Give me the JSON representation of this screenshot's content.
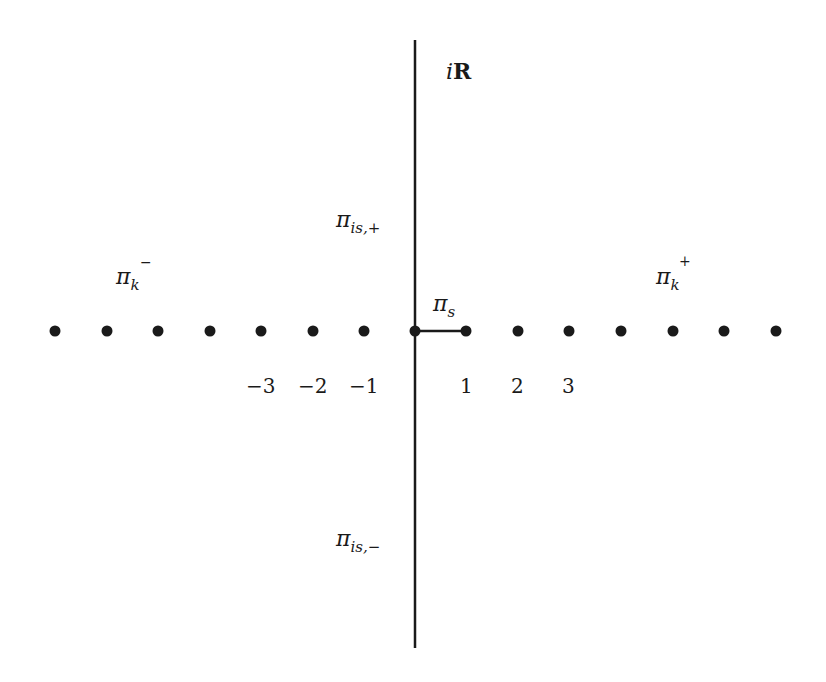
{
  "diagram": {
    "axis_label": {
      "prefix": "i",
      "main": "R"
    },
    "labels": {
      "pi_is_plus": {
        "base": "π",
        "sub": "is,+"
      },
      "pi_is_minus": {
        "base": "π",
        "sub": "is,−"
      },
      "pi_k_minus": {
        "base": "π",
        "sub": "k",
        "sup": "−"
      },
      "pi_k_plus": {
        "base": "π",
        "sub": "k",
        "sup": "+"
      },
      "pi_s": {
        "base": "π",
        "sub": "s"
      }
    },
    "ticks": {
      "neg3": "−3",
      "neg2": "−2",
      "neg1": "−1",
      "pos1": "1",
      "pos2": "2",
      "pos3": "3"
    },
    "points": {
      "x_positions": [
        55,
        107,
        158,
        210,
        261,
        313,
        364,
        415,
        466,
        518,
        569,
        621,
        673,
        724,
        776
      ],
      "y": 331,
      "integer_values": [
        -7,
        -6,
        -5,
        -4,
        -3,
        -2,
        -1,
        0,
        1,
        2,
        3,
        4,
        5,
        6,
        7
      ]
    },
    "segment": {
      "from": 0,
      "to": 1
    },
    "colors": {
      "ink": "#1a1a1a",
      "background": "#ffffff"
    }
  }
}
